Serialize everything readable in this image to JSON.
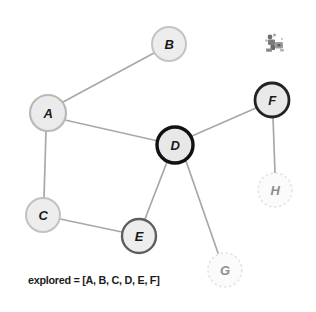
{
  "diagram": {
    "caption": "explored = [A, B, C, D, E, F]",
    "colors": {
      "background": "#ffffff",
      "node_fill": "#ebebeb",
      "node_fill_faded": "#f7f7f7",
      "edge": "#a8a8a8",
      "border_light": "#c9c9c9",
      "border_mid": "#9a9a9a",
      "border_dark": "#4a4a4a",
      "border_current": "#111111",
      "border_unexplored": "#e2e2e2",
      "label": "#1a1a1a",
      "label_faded": "#8e8e8e"
    },
    "nodes": [
      {
        "id": "A",
        "label": "A",
        "cx": 48,
        "cy": 113,
        "r": 18,
        "state": "explored",
        "stroke": "#b9b9b9",
        "stroke_width": 2.2,
        "fill": "#ebebeb",
        "dashed": false,
        "faded": false
      },
      {
        "id": "B",
        "label": "B",
        "cx": 169,
        "cy": 44,
        "r": 17,
        "state": "explored",
        "stroke": "#c4c4c4",
        "stroke_width": 2.0,
        "fill": "#ededed",
        "dashed": false,
        "faded": false
      },
      {
        "id": "C",
        "label": "C",
        "cx": 43,
        "cy": 215,
        "r": 17,
        "state": "explored",
        "stroke": "#c2c2c2",
        "stroke_width": 2.0,
        "fill": "#ededed",
        "dashed": false,
        "faded": false
      },
      {
        "id": "D",
        "label": "D",
        "cx": 175,
        "cy": 145,
        "r": 18,
        "state": "current",
        "stroke": "#111111",
        "stroke_width": 3.4,
        "fill": "#e8e8e8",
        "dashed": false,
        "faded": false
      },
      {
        "id": "E",
        "label": "E",
        "cx": 139,
        "cy": 236,
        "r": 17,
        "state": "explored",
        "stroke": "#5e5e5e",
        "stroke_width": 2.4,
        "fill": "#ededed",
        "dashed": false,
        "faded": false
      },
      {
        "id": "F",
        "label": "F",
        "cx": 272,
        "cy": 100,
        "r": 17,
        "state": "explored",
        "stroke": "#232323",
        "stroke_width": 2.8,
        "fill": "#e9e9e9",
        "dashed": false,
        "faded": false
      },
      {
        "id": "G",
        "label": "G",
        "cx": 225,
        "cy": 270,
        "r": 17,
        "state": "unexplored",
        "stroke": "#e4e4e4",
        "stroke_width": 1.6,
        "fill": "#fbfbfb",
        "dashed": true,
        "faded": true
      },
      {
        "id": "H",
        "label": "H",
        "cx": 275,
        "cy": 190,
        "r": 17,
        "state": "unexplored",
        "stroke": "#e4e4e4",
        "stroke_width": 1.6,
        "fill": "#fbfbfb",
        "dashed": true,
        "faded": true
      }
    ],
    "edges": [
      {
        "from": "A",
        "to": "B",
        "x1": 63,
        "y1": 102,
        "x2": 154,
        "y2": 53
      },
      {
        "from": "A",
        "to": "D",
        "x1": 65,
        "y1": 120,
        "x2": 158,
        "y2": 141
      },
      {
        "from": "A",
        "to": "C",
        "x1": 46,
        "y1": 131,
        "x2": 44,
        "y2": 198
      },
      {
        "from": "C",
        "to": "E",
        "x1": 60,
        "y1": 219,
        "x2": 122,
        "y2": 232
      },
      {
        "from": "D",
        "to": "E",
        "x1": 167,
        "y1": 162,
        "x2": 145,
        "y2": 219
      },
      {
        "from": "D",
        "to": "F",
        "x1": 192,
        "y1": 136,
        "x2": 256,
        "y2": 108
      },
      {
        "from": "D",
        "to": "G",
        "x1": 186,
        "y1": 161,
        "x2": 218,
        "y2": 253
      },
      {
        "from": "F",
        "to": "H",
        "x1": 273,
        "y1": 117,
        "x2": 275,
        "y2": 173
      }
    ],
    "icon": {
      "name": "robot-sprite-icon",
      "x": 261,
      "y": 31
    }
  }
}
